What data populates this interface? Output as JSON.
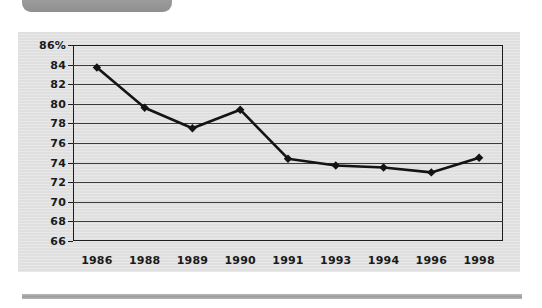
{
  "page": {
    "top_tab_label": "",
    "background_color": "#ffffff",
    "panel_color": "#e2e2e2"
  },
  "chart_data": {
    "type": "line",
    "title": "",
    "subtitle": "",
    "xlabel": "",
    "ylabel": "",
    "categories": [
      "1986",
      "1988",
      "1989",
      "1990",
      "1991",
      "1993",
      "1994",
      "1996",
      "1998"
    ],
    "values": [
      83.7,
      79.6,
      77.5,
      79.4,
      74.4,
      73.7,
      73.5,
      73.0,
      74.5
    ],
    "series": [
      {
        "name": "",
        "values": [
          83.7,
          79.6,
          77.5,
          79.4,
          74.4,
          73.7,
          73.5,
          73.0,
          74.5
        ]
      }
    ],
    "ylim": [
      66,
      86
    ],
    "ytick_step": 2,
    "ytick_labels": [
      "86%",
      "84",
      "82",
      "80",
      "78",
      "76",
      "74",
      "72",
      "70",
      "68",
      "66"
    ],
    "ytick_values": [
      86,
      84,
      82,
      80,
      78,
      76,
      74,
      72,
      70,
      68,
      66
    ],
    "xtick_labels": [
      "1986",
      "1988",
      "1989",
      "1990",
      "1991",
      "1993",
      "1994",
      "1996",
      "1998"
    ],
    "unit": "%",
    "grid": true,
    "grid_axis": "y",
    "legend": false,
    "legend_position": "none",
    "line_color": "#141414",
    "marker": "diamond",
    "marker_color": "#141414",
    "annotations": []
  }
}
